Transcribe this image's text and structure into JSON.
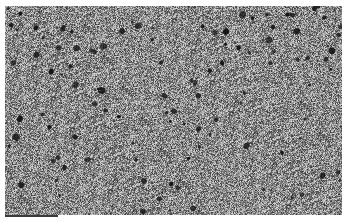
{
  "image": {
    "description": "Grayscale electron micrograph of a porous surface texture",
    "width": 347,
    "height": 222,
    "frame": {
      "x": 5,
      "y": 6,
      "width": 337,
      "height": 209
    },
    "colors": {
      "background": "#ffffff",
      "base_gray": "#8a8a8a",
      "pore": "#141414",
      "highlight": "#d8d8d8"
    },
    "pore_count": 110,
    "scale_bar": {
      "x": 5,
      "y": 215,
      "width": 53,
      "height": 2,
      "color": "#3a3a3a"
    }
  }
}
